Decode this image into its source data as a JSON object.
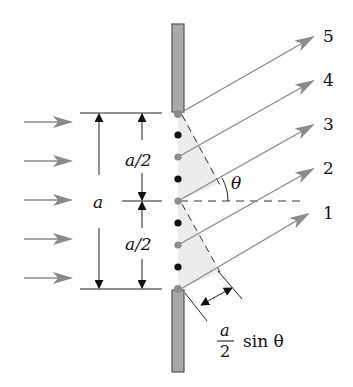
{
  "figure": {
    "colors": {
      "ray": "#8a8a8a",
      "barrier_fill": "#a9a9a9",
      "barrier_stroke": "#555555",
      "shade": "#ececec",
      "dot_black": "#111111",
      "dot_gray": "#8c8c8c",
      "line": "#222222"
    },
    "incoming_arrows": {
      "count": 5,
      "y": [
        122,
        161,
        200,
        239,
        278
      ]
    },
    "slit_width_label": "a",
    "half_width_label_top": "a/2",
    "half_width_label_bottom": "a/2",
    "angle_label": "θ",
    "path_difference_label": {
      "numerator": "a",
      "denominator": "2",
      "suffix": "sin θ"
    },
    "rays": [
      {
        "label": "1",
        "from": [
          181,
          289
        ],
        "to": [
          308,
          214
        ]
      },
      {
        "label": "2",
        "from": [
          178,
          245
        ],
        "to": [
          313,
          169
        ]
      },
      {
        "label": "3",
        "from": [
          178,
          201
        ],
        "to": [
          313,
          125
        ]
      },
      {
        "label": "4",
        "from": [
          178,
          157
        ],
        "to": [
          313,
          81
        ]
      },
      {
        "label": "5",
        "from": [
          182,
          112
        ],
        "to": [
          313,
          37
        ]
      }
    ],
    "slit_points": [
      {
        "y": 114,
        "color": "gray"
      },
      {
        "y": 135,
        "color": "black"
      },
      {
        "y": 157,
        "color": "gray"
      },
      {
        "y": 179,
        "color": "black"
      },
      {
        "y": 201,
        "color": "gray"
      },
      {
        "y": 223,
        "color": "black"
      },
      {
        "y": 245,
        "color": "gray"
      },
      {
        "y": 267,
        "color": "black"
      },
      {
        "y": 289,
        "color": "gray"
      }
    ]
  }
}
